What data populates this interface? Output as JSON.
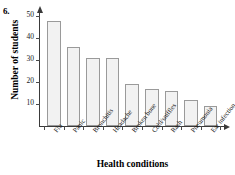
{
  "problem": {
    "number": "6."
  },
  "chart_data": {
    "type": "bar",
    "title": "",
    "xlabel": "Health conditions",
    "ylabel": "Number of students",
    "categories": [
      "Flu",
      "Panic",
      "Bronchitis",
      "Headache",
      "Broken bone",
      "Cold/sniffles",
      "Rash",
      "Pneumonia",
      "Ear infection"
    ],
    "values": [
      48,
      36,
      31,
      31,
      19,
      17,
      16,
      12,
      9
    ],
    "ylim": [
      0,
      52
    ],
    "yticks": [
      10,
      20,
      30,
      40,
      50
    ],
    "ytick_labels": [
      "10",
      "20",
      "30",
      "40",
      "50"
    ],
    "grid": false,
    "legend": null,
    "bar_fill_color": "#f2f2f2",
    "bar_border_color": "#9a9a9a",
    "axis_color": "#3a3a3a"
  }
}
